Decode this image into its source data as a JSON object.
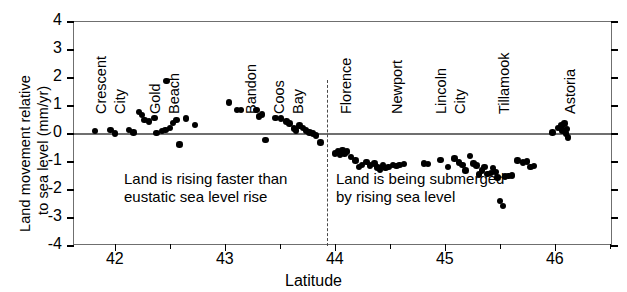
{
  "axes": {
    "ylabel_line1": "Land movement relative",
    "ylabel_line2": "to sea level (mm/yr)",
    "xlabel": "Latitude",
    "yticks": [
      "4",
      "3",
      "2",
      "1",
      "0",
      "-1",
      "-2",
      "-3",
      "-4"
    ],
    "xticks": [
      "42",
      "43",
      "44",
      "45",
      "46"
    ]
  },
  "annotations": {
    "left_line1": "Land is rising faster than",
    "left_line2": "eustatic sea level rise",
    "right_line1": "Land is being submerged",
    "right_line2": "by rising sea level"
  },
  "cities": [
    {
      "label": "Crescent",
      "lat": 41.76
    },
    {
      "label": "City",
      "lat": 41.93
    },
    {
      "label": "Gold",
      "lat": 42.25
    },
    {
      "label": "Beach",
      "lat": 42.42
    },
    {
      "label": "Bandon",
      "lat": 43.12
    },
    {
      "label": "Coos",
      "lat": 43.37
    },
    {
      "label": "Bay",
      "lat": 43.55
    },
    {
      "label": "Florence",
      "lat": 43.98
    },
    {
      "label": "Newport",
      "lat": 44.45
    },
    {
      "label": "Lincoln",
      "lat": 44.85
    },
    {
      "label": "City",
      "lat": 45.02
    },
    {
      "label": "Tillamook",
      "lat": 45.42
    },
    {
      "label": "Astoria",
      "lat": 46.02
    }
  ],
  "chart_data": {
    "type": "scatter",
    "title": "",
    "xlabel": "Latitude",
    "ylabel": "Land movement relative to sea level (mm/yr)",
    "xlim": [
      41.62,
      46.52
    ],
    "ylim": [
      -4,
      4
    ],
    "grid": false,
    "legend": null,
    "reference_lines": [
      {
        "kind": "horizontal",
        "y": 0,
        "style": "solid"
      },
      {
        "kind": "vertical",
        "x": 43.92,
        "style": "dashed"
      }
    ],
    "series": [
      {
        "name": "Tide gauge / leveling sites",
        "marker": "filled-circle",
        "color": "#000000",
        "points": [
          [
            41.81,
            0.1
          ],
          [
            41.95,
            0.15
          ],
          [
            41.99,
            0.02
          ],
          [
            42.12,
            0.15
          ],
          [
            42.16,
            0.05
          ],
          [
            42.21,
            0.78
          ],
          [
            42.24,
            0.68
          ],
          [
            42.26,
            0.5
          ],
          [
            42.3,
            0.45
          ],
          [
            42.35,
            0.57
          ],
          [
            42.37,
            0.03
          ],
          [
            42.42,
            0.1
          ],
          [
            42.45,
            0.15
          ],
          [
            42.46,
            1.9
          ],
          [
            42.49,
            0.22
          ],
          [
            42.52,
            0.4
          ],
          [
            42.55,
            0.5
          ],
          [
            42.58,
            -0.38
          ],
          [
            42.64,
            0.55
          ],
          [
            42.72,
            0.33
          ],
          [
            43.03,
            1.12
          ],
          [
            43.1,
            0.85
          ],
          [
            43.14,
            0.85
          ],
          [
            43.28,
            0.85
          ],
          [
            43.3,
            0.62
          ],
          [
            43.33,
            0.7
          ],
          [
            43.36,
            -0.22
          ],
          [
            43.45,
            0.57
          ],
          [
            43.5,
            0.56
          ],
          [
            43.55,
            0.44
          ],
          [
            43.58,
            0.38
          ],
          [
            43.62,
            0.2
          ],
          [
            43.64,
            0.12
          ],
          [
            43.67,
            0.3
          ],
          [
            43.7,
            0.22
          ],
          [
            43.73,
            0.12
          ],
          [
            43.76,
            0.05
          ],
          [
            43.79,
            0.02
          ],
          [
            43.82,
            -0.05
          ],
          [
            43.86,
            -0.3
          ],
          [
            43.99,
            -0.7
          ],
          [
            44.02,
            -0.62
          ],
          [
            44.04,
            -0.75
          ],
          [
            44.06,
            -0.58
          ],
          [
            44.08,
            -0.7
          ],
          [
            44.1,
            -0.62
          ],
          [
            44.14,
            -0.82
          ],
          [
            44.18,
            -0.95
          ],
          [
            44.21,
            -1.18
          ],
          [
            44.24,
            -1.1
          ],
          [
            44.28,
            -1.0
          ],
          [
            44.31,
            -1.12
          ],
          [
            44.35,
            -1.05
          ],
          [
            44.38,
            -1.2
          ],
          [
            44.4,
            -1.28
          ],
          [
            44.43,
            -1.12
          ],
          [
            44.45,
            -1.22
          ],
          [
            44.48,
            -1.18
          ],
          [
            44.52,
            -1.1
          ],
          [
            44.55,
            -1.15
          ],
          [
            44.58,
            -1.1
          ],
          [
            44.62,
            -1.08
          ],
          [
            44.8,
            -1.05
          ],
          [
            44.84,
            -1.08
          ],
          [
            44.95,
            -0.92
          ],
          [
            45.02,
            -1.18
          ],
          [
            45.08,
            -0.88
          ],
          [
            45.12,
            -1.02
          ],
          [
            45.15,
            -1.1
          ],
          [
            45.18,
            -1.3
          ],
          [
            45.22,
            -0.78
          ],
          [
            45.25,
            -1.05
          ],
          [
            45.28,
            -1.12
          ],
          [
            45.3,
            -1.45
          ],
          [
            45.33,
            -1.3
          ],
          [
            45.35,
            -1.18
          ],
          [
            45.38,
            -1.42
          ],
          [
            45.41,
            -1.4
          ],
          [
            45.43,
            -1.22
          ],
          [
            45.45,
            -1.35
          ],
          [
            45.47,
            -1.55
          ],
          [
            45.49,
            -2.4
          ],
          [
            45.52,
            -2.58
          ],
          [
            45.54,
            -1.52
          ],
          [
            45.57,
            -1.5
          ],
          [
            45.6,
            -1.48
          ],
          [
            45.65,
            -0.95
          ],
          [
            45.7,
            -1.02
          ],
          [
            45.74,
            -0.98
          ],
          [
            45.77,
            -1.18
          ],
          [
            45.8,
            -1.15
          ],
          [
            45.97,
            0.05
          ],
          [
            46.02,
            0.22
          ],
          [
            46.05,
            0.3
          ],
          [
            46.06,
            0.12
          ],
          [
            46.08,
            0.38
          ],
          [
            46.09,
            0.02
          ],
          [
            46.1,
            0.18
          ],
          [
            46.11,
            -0.12
          ]
        ]
      }
    ]
  }
}
